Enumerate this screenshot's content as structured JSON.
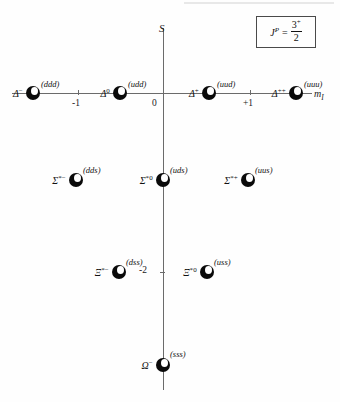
{
  "legend": {
    "symbol": "J",
    "symbol_sup": "P",
    "equals": "=",
    "numerator": "3",
    "numerator_sup": "+",
    "denominator": "2"
  },
  "axes": {
    "vertical_label": "S",
    "horizontal_label": "m",
    "horizontal_label_sub": "I",
    "x_ticks": [
      {
        "label": "-1",
        "value": -1
      },
      {
        "label": "0",
        "value": 0
      },
      {
        "label": "+1",
        "value": 1
      }
    ],
    "y_ticks": [
      {
        "label": "-2",
        "value": -2
      }
    ]
  },
  "chart_data": {
    "type": "scatter",
    "xlabel": "m_I",
    "ylabel": "S",
    "xlim": [
      -2.2,
      2.2
    ],
    "ylim": [
      -3.4,
      0.6
    ],
    "grid": false,
    "legend": "J^P = 3/2+",
    "points": [
      {
        "name": "Delta-minus",
        "symbol": "Δ",
        "charge": "−",
        "quarks": "(ddd)",
        "m_I": -1.5,
        "S": 0
      },
      {
        "name": "Delta-zero",
        "symbol": "Δ",
        "charge": "0",
        "quarks": "(udd)",
        "m_I": -0.5,
        "S": 0
      },
      {
        "name": "Delta-plus",
        "symbol": "Δ",
        "charge": "+",
        "quarks": "(uud)",
        "m_I": 0.5,
        "S": 0
      },
      {
        "name": "Delta-plus-plus",
        "symbol": "Δ",
        "charge": "++",
        "quarks": "(uuu)",
        "m_I": 1.5,
        "S": 0
      },
      {
        "name": "Sigma-star-minus",
        "symbol": "Σ",
        "charge": "*−",
        "quarks": "(dds)",
        "m_I": -1,
        "S": -1
      },
      {
        "name": "Sigma-star-zero",
        "symbol": "Σ",
        "charge": "*0",
        "quarks": "(uds)",
        "m_I": 0,
        "S": -1
      },
      {
        "name": "Sigma-star-plus",
        "symbol": "Σ",
        "charge": "*+",
        "quarks": "(uus)",
        "m_I": 1,
        "S": -1
      },
      {
        "name": "Xi-star-minus",
        "symbol": "Ξ",
        "charge": "*−",
        "quarks": "(dss)",
        "m_I": -0.5,
        "S": -2
      },
      {
        "name": "Xi-star-zero",
        "symbol": "Ξ",
        "charge": "*0",
        "quarks": "(uss)",
        "m_I": 0.5,
        "S": -2
      },
      {
        "name": "Omega-minus",
        "symbol": "Ω",
        "charge": "−",
        "quarks": "(sss)",
        "m_I": 0,
        "S": -3
      }
    ]
  },
  "particles": [
    {
      "symbol": "Δ",
      "charge": "−",
      "quarks": "(ddd)",
      "x": 33,
      "y": 93,
      "sym_dx": -10,
      "q_dx": 8,
      "q_dy": -14
    },
    {
      "symbol": "Δ",
      "charge": "0",
      "quarks": "(udd)",
      "x": 120,
      "y": 93,
      "sym_dx": -10,
      "q_dx": 8,
      "q_dy": -14
    },
    {
      "symbol": "Δ",
      "charge": "+",
      "quarks": "(uud)",
      "x": 209,
      "y": 93,
      "sym_dx": -10,
      "q_dx": 8,
      "q_dy": -14
    },
    {
      "symbol": "Δ",
      "charge": "++",
      "quarks": "(uuu)",
      "x": 296,
      "y": 93,
      "sym_dx": -10,
      "q_dx": 8,
      "q_dy": -14
    },
    {
      "symbol": "Σ",
      "charge": "*−",
      "quarks": "(dds)",
      "x": 76,
      "y": 180,
      "sym_dx": -10,
      "q_dx": 7,
      "q_dy": -15
    },
    {
      "symbol": "Σ",
      "charge": "*0",
      "quarks": "(uds)",
      "x": 163,
      "y": 180,
      "sym_dx": -10,
      "q_dx": 7,
      "q_dy": -15
    },
    {
      "symbol": "Σ",
      "charge": "*+",
      "quarks": "(uus)",
      "x": 248,
      "y": 180,
      "sym_dx": -10,
      "q_dx": 7,
      "q_dy": -15
    },
    {
      "symbol": "Ξ",
      "charge": "*−",
      "quarks": "(dss)",
      "x": 119,
      "y": 272,
      "sym_dx": -10,
      "q_dx": 7,
      "q_dy": -15
    },
    {
      "symbol": "Ξ",
      "charge": "*0",
      "quarks": "(uss)",
      "x": 207,
      "y": 272,
      "sym_dx": -10,
      "q_dx": 7,
      "q_dy": -15
    },
    {
      "symbol": "Ω",
      "charge": "−",
      "quarks": "(sss)",
      "x": 163,
      "y": 365,
      "sym_dx": -10,
      "q_dx": 7,
      "q_dy": -16
    }
  ],
  "tick_marks": {
    "x_minus1": {
      "label": "-1",
      "x": 78,
      "label_x": 72,
      "label_y": 98
    },
    "x_zero": {
      "label": "0",
      "x": 163,
      "label_x": 152,
      "label_y": 98
    },
    "x_plus1": {
      "label": "+1",
      "x": 250,
      "label_x": 243,
      "label_y": 98
    },
    "y_minus2": {
      "label": "-2",
      "y": 272,
      "label_x": 139,
      "label_y": 265
    }
  }
}
